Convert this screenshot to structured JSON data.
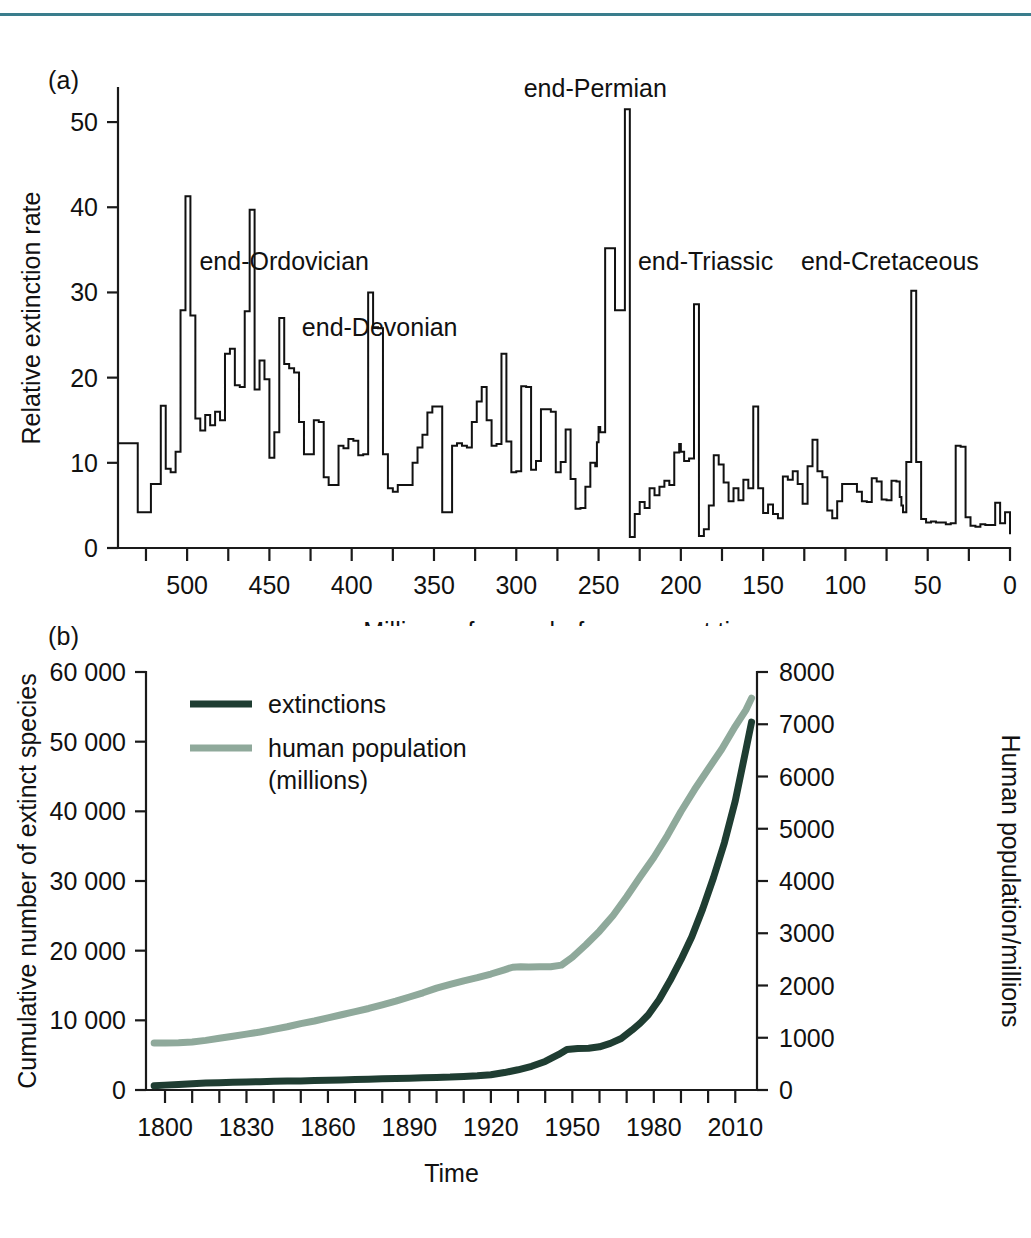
{
  "figure": {
    "rule_color": "#3a7d8c",
    "panel_a_tag": "(a)",
    "panel_b_tag": "(b)"
  },
  "chart_data": [
    {
      "id": "panel-a",
      "type": "line",
      "title": "",
      "xlabel": "Millions of years before present time",
      "ylabel": "Relative extinction rate",
      "xlim": [
        542,
        0
      ],
      "ylim": [
        0,
        54
      ],
      "x_reversed": true,
      "grid": false,
      "legend": "none",
      "x_tick_labels": [
        "500",
        "450",
        "400",
        "350",
        "300",
        "250",
        "200",
        "150",
        "100",
        "50",
        "0"
      ],
      "x_tick_values": [
        500,
        450,
        400,
        350,
        300,
        250,
        200,
        150,
        100,
        50,
        0
      ],
      "x_minor_tick_values": [
        525,
        475,
        425,
        375,
        325,
        275,
        225,
        175,
        125,
        75,
        25
      ],
      "y_tick_labels": [
        "0",
        "10",
        "20",
        "30",
        "40",
        "50"
      ],
      "y_tick_values": [
        0,
        10,
        20,
        30,
        40,
        50
      ],
      "line_color": "#111111",
      "annotations": [
        {
          "text": "end-Ordovician",
          "x": 441,
          "y": 32.6,
          "anchor": "middle"
        },
        {
          "text": "end-Devonian",
          "x": 383,
          "y": 24.9,
          "anchor": "middle"
        },
        {
          "text": "end-Permian",
          "x": 252,
          "y": 53.0,
          "anchor": "middle"
        },
        {
          "text": "end-Triassic",
          "x": 185,
          "y": 32.6,
          "anchor": "middle"
        },
        {
          "text": "end-Cretaceous",
          "x": 73,
          "y": 32.6,
          "anchor": "middle"
        }
      ],
      "series": [
        {
          "name": "relative extinction rate",
          "step": true,
          "x": [
            542,
            538,
            534,
            530,
            526,
            522,
            519,
            516,
            513,
            510,
            507,
            504,
            501,
            498,
            495,
            492,
            489,
            486,
            483,
            480,
            477,
            474,
            471,
            468,
            465,
            462,
            459,
            456,
            453,
            450,
            447,
            444,
            441,
            438,
            435,
            432,
            429,
            426,
            423,
            420,
            417,
            414,
            411,
            408,
            405,
            402,
            399,
            396,
            393,
            390,
            387,
            384,
            381,
            378,
            375,
            372,
            369,
            366,
            363,
            360,
            357,
            354,
            351,
            348,
            345,
            342,
            339,
            336,
            333,
            330,
            327,
            324,
            321,
            318,
            315,
            312,
            309,
            306,
            303,
            300,
            297,
            294,
            291,
            288,
            285,
            282,
            279,
            276,
            273,
            270,
            267,
            264,
            261,
            258,
            255,
            252,
            251,
            250,
            249,
            246,
            243,
            240,
            237,
            234,
            231,
            228,
            225,
            222,
            219,
            216,
            213,
            210,
            207,
            204,
            201,
            200,
            198,
            195,
            192,
            189,
            186,
            183,
            180,
            177,
            174,
            171,
            168,
            165,
            162,
            159,
            156,
            153,
            150,
            147,
            144,
            141,
            138,
            135,
            132,
            129,
            126,
            123,
            120,
            117,
            114,
            111,
            108,
            105,
            102,
            99,
            96,
            93,
            90,
            87,
            84,
            81,
            78,
            75,
            72,
            69,
            67,
            66,
            65,
            63,
            60,
            57,
            54,
            51,
            48,
            45,
            42,
            39,
            36,
            33,
            30,
            27,
            24,
            21,
            18,
            15,
            12,
            9,
            6,
            3,
            0
          ],
          "y": [
            12.3,
            12.3,
            12.3,
            4.2,
            4.2,
            7.5,
            7.5,
            16.7,
            9.3,
            8.9,
            11.3,
            27.9,
            41.3,
            27.3,
            15.2,
            13.8,
            15.6,
            14.4,
            16.0,
            15.0,
            22.8,
            23.4,
            19.1,
            18.9,
            27.8,
            39.7,
            18.6,
            22.0,
            19.8,
            10.6,
            13.6,
            27.0,
            21.6,
            21.1,
            20.6,
            14.8,
            11.0,
            11.0,
            15.0,
            14.8,
            8.3,
            7.4,
            7.4,
            12.0,
            11.7,
            12.8,
            12.6,
            10.9,
            11.0,
            30.0,
            25.9,
            25.8,
            11.0,
            7.0,
            6.6,
            7.4,
            7.4,
            7.4,
            10.0,
            11.8,
            13.3,
            15.9,
            16.6,
            16.6,
            4.2,
            4.2,
            12.0,
            12.3,
            12.0,
            11.8,
            14.8,
            17.2,
            18.9,
            15.0,
            12.0,
            12.2,
            22.8,
            12.5,
            8.9,
            9.0,
            19.0,
            18.9,
            9.2,
            10.2,
            16.3,
            16.3,
            16.0,
            8.9,
            10.1,
            13.9,
            8.1,
            4.6,
            4.7,
            7.2,
            10.0,
            9.6,
            12.4,
            14.2,
            13.6,
            35.2,
            35.2,
            27.9,
            27.9,
            51.5,
            1.3,
            4.0,
            5.4,
            4.7,
            7.0,
            6.2,
            7.2,
            7.9,
            7.4,
            11.2,
            12.2,
            11.3,
            10.2,
            10.5,
            28.6,
            1.4,
            2.2,
            5.0,
            10.9,
            9.8,
            7.7,
            5.5,
            7.0,
            5.6,
            8.0,
            7.0,
            16.6,
            7.0,
            4.1,
            5.1,
            4.0,
            3.5,
            8.4,
            8.0,
            9.0,
            7.5,
            5.2,
            9.6,
            12.7,
            9.0,
            8.3,
            4.4,
            3.5,
            5.5,
            7.5,
            7.5,
            7.5,
            6.6,
            5.5,
            5.4,
            8.2,
            7.8,
            5.7,
            5.6,
            7.9,
            7.8,
            6.0,
            5.0,
            4.2,
            10.1,
            30.2,
            10.1,
            3.4,
            3.0,
            3.1,
            3.0,
            3.0,
            2.8,
            2.9,
            12.0,
            11.9,
            3.6,
            2.6,
            2.5,
            2.8,
            2.7,
            2.7,
            5.3,
            2.9,
            4.2,
            1.6,
            1.6,
            1.8
          ]
        }
      ]
    },
    {
      "id": "panel-b",
      "type": "line",
      "title": "",
      "xlabel": "Time",
      "ylabel": "Cumulative number of extinct species",
      "y2label": "Human population/millions",
      "xlim": [
        1793,
        2018
      ],
      "ylim": [
        0,
        60000
      ],
      "y2lim": [
        0,
        8000
      ],
      "grid": false,
      "legend": "upper-left",
      "x_tick_labels": [
        "1800",
        "1830",
        "1860",
        "1890",
        "1920",
        "1950",
        "1980",
        "2010"
      ],
      "x_tick_values": [
        1800,
        1830,
        1860,
        1890,
        1920,
        1950,
        1980,
        2010
      ],
      "x_minor_tick_values": [
        1810,
        1820,
        1840,
        1850,
        1870,
        1880,
        1900,
        1910,
        1930,
        1940,
        1960,
        1970,
        1990,
        2000
      ],
      "y_tick_labels": [
        "0",
        "10 000",
        "20 000",
        "30 000",
        "40 000",
        "50 000",
        "60 000"
      ],
      "y_tick_values": [
        0,
        10000,
        20000,
        30000,
        40000,
        50000,
        60000
      ],
      "y2_tick_labels": [
        "0",
        "1000",
        "2000",
        "3000",
        "4000",
        "5000",
        "6000",
        "7000",
        "8000"
      ],
      "y2_tick_values": [
        0,
        1000,
        2000,
        3000,
        4000,
        5000,
        6000,
        7000,
        8000
      ],
      "series": [
        {
          "name": "extinctions",
          "legend_label": "extinctions",
          "color": "#1f3d32",
          "axis": "left",
          "x": [
            1796,
            1800,
            1805,
            1810,
            1815,
            1820,
            1825,
            1830,
            1835,
            1840,
            1845,
            1850,
            1855,
            1860,
            1865,
            1870,
            1875,
            1880,
            1885,
            1890,
            1895,
            1900,
            1905,
            1910,
            1915,
            1920,
            1925,
            1930,
            1935,
            1940,
            1945,
            1948,
            1952,
            1956,
            1960,
            1964,
            1968,
            1972,
            1975,
            1978,
            1982,
            1986,
            1990,
            1994,
            1998,
            2002,
            2006,
            2010,
            2014,
            2016
          ],
          "y": [
            600,
            700,
            800,
            900,
            1000,
            1050,
            1100,
            1150,
            1200,
            1250,
            1280,
            1300,
            1350,
            1400,
            1450,
            1500,
            1550,
            1600,
            1650,
            1700,
            1750,
            1800,
            1850,
            1950,
            2050,
            2200,
            2500,
            2900,
            3400,
            4100,
            5100,
            5800,
            5950,
            6000,
            6200,
            6700,
            7400,
            8600,
            9600,
            10800,
            13000,
            15700,
            18700,
            22000,
            26000,
            30500,
            35500,
            41500,
            49000,
            52800
          ]
        },
        {
          "name": "human population (millions)",
          "legend_label": "human population\n(millions)",
          "color": "#8fa99b",
          "axis": "right",
          "x": [
            1796,
            1800,
            1805,
            1810,
            1815,
            1820,
            1825,
            1830,
            1835,
            1840,
            1845,
            1850,
            1855,
            1860,
            1865,
            1870,
            1875,
            1880,
            1885,
            1890,
            1895,
            1900,
            1905,
            1910,
            1915,
            1920,
            1925,
            1928,
            1931,
            1934,
            1938,
            1942,
            1946,
            1950,
            1955,
            1960,
            1965,
            1970,
            1975,
            1980,
            1985,
            1990,
            1995,
            2000,
            2005,
            2010,
            2014,
            2016
          ],
          "y": [
            900,
            900,
            905,
            920,
            950,
            990,
            1030,
            1070,
            1110,
            1160,
            1210,
            1270,
            1320,
            1380,
            1440,
            1500,
            1560,
            1630,
            1700,
            1780,
            1860,
            1950,
            2020,
            2090,
            2150,
            2220,
            2300,
            2350,
            2360,
            2355,
            2360,
            2360,
            2390,
            2540,
            2780,
            3040,
            3340,
            3700,
            4080,
            4450,
            4870,
            5330,
            5750,
            6140,
            6520,
            6960,
            7280,
            7500
          ]
        }
      ]
    }
  ]
}
